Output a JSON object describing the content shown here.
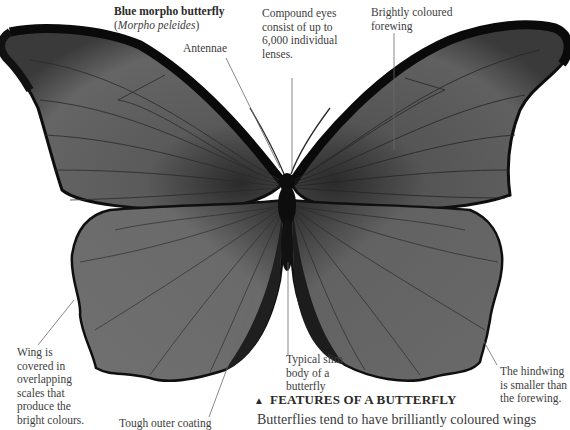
{
  "title": {
    "common_name": "Blue morpho butterfly",
    "scientific_name": "Morpho peleides"
  },
  "annotations": {
    "antennae": "Antennae",
    "compound_eyes": [
      "Compound eyes",
      "consist of up to",
      "6,000 individual",
      "lenses."
    ],
    "forewing": [
      "Brightly coloured",
      "forewing"
    ],
    "wing_scales": [
      "Wing is",
      "covered in",
      "overlapping",
      "scales that",
      "produce the",
      "bright colours."
    ],
    "outer_coating": "Tough outer coating",
    "body": [
      "Typical slim",
      "body of a",
      "butterfly"
    ],
    "hindwing": [
      "The hindwing",
      "is smaller than",
      "the forewing."
    ]
  },
  "section": {
    "marker": "▲",
    "heading": "FEATURES OF A BUTTERFLY",
    "body_start": "Butterflies tend to have brilliantly coloured wings"
  },
  "colors": {
    "wing_fill": "#5e5e5e",
    "wing_edge": "#111111",
    "body": "#0d0d0d",
    "text": "#3d3d3d",
    "leader_line": "#6a6a6a"
  }
}
